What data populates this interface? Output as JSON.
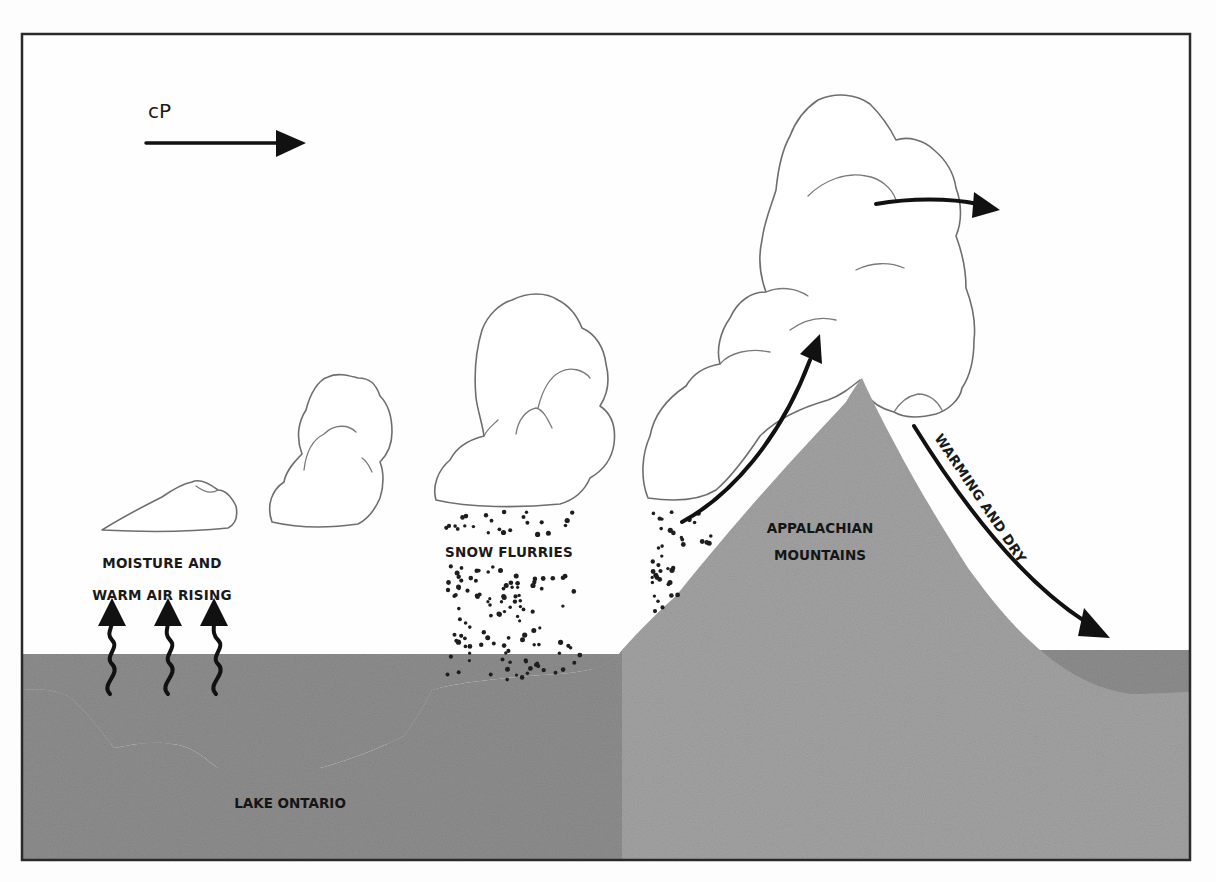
{
  "figure": {
    "colors": {
      "sky": "#fdfdfd",
      "lake": "#bdbdbd",
      "land": "#8c8c8c",
      "mountain": "#a3a3a3",
      "ink": "#111111",
      "frame": "#2a2a2a"
    }
  },
  "labels": {
    "air_mass": "cP",
    "moisture_line1": "MOISTURE AND",
    "moisture_line2": "WARM AIR RISING",
    "snow_flurries": "SNOW FLURRIES",
    "mountains_line1": "APPALACHIAN",
    "mountains_line2": "MOUNTAINS",
    "warming_dry": "WARMING AND DRY",
    "lake": "LAKE ONTARIO"
  },
  "icons": {
    "cp_arrow": "arrow-right-icon",
    "rising_arrows": [
      "wavy-arrow-up-icon",
      "wavy-arrow-up-icon",
      "wavy-arrow-up-icon"
    ],
    "upslope_arrow": "curved-arrow-up-icon",
    "outflow_arrow": "arrow-right-icon",
    "downslope_arrow": "curved-arrow-down-icon"
  }
}
